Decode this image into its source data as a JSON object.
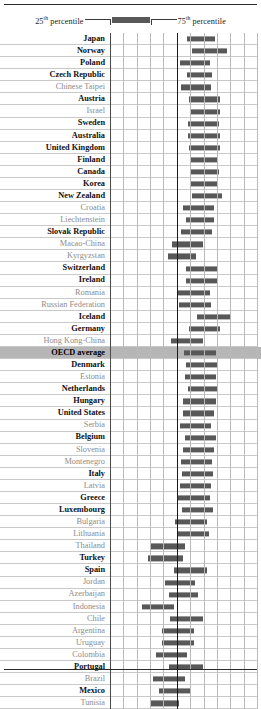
{
  "legend": {
    "left_label_prefix": "25",
    "left_label_sup": "th",
    "left_label_suffix": " percentile",
    "right_label_prefix": "75",
    "right_label_sup": "th",
    "right_label_suffix": " percentile",
    "bar_color": "#585858"
  },
  "chart_data": {
    "type": "bar",
    "subtype": "range-bar",
    "title": "",
    "xlabel": "",
    "ylabel": "",
    "grid": true,
    "legend_position": "top-center",
    "axis_reference_line": 500,
    "xlim": [
      300,
      740
    ],
    "xticks": [
      300,
      340,
      380,
      420,
      460,
      500,
      540,
      580,
      620,
      660,
      700,
      740
    ],
    "series_name": "Interquartile range of student score",
    "range_low_label": "25th percentile",
    "range_high_label": "75th percentile",
    "highlight_row": "OECD average",
    "highlight_color": "#b6b6b6",
    "categories": [
      "Japan",
      "Norway",
      "Poland",
      "Czech Republic",
      "Chinese Taipei",
      "Austria",
      "Israel",
      "Sweden",
      "Australia",
      "United Kingdom",
      "Finland",
      "Canada",
      "Korea",
      "New Zealand",
      "Croatia",
      "Liechtenstein",
      "Slovak Republic",
      "Macao-China",
      "Kyrgyzstan",
      "Switzerland",
      "Ireland",
      "Romania",
      "Russian Federation",
      "Iceland",
      "Germany",
      "Hong Kong-China",
      "OECD average",
      "Denmark",
      "Estonia",
      "Netherlands",
      "Hungary",
      "United States",
      "Serbia",
      "Belgium",
      "Slovenia",
      "Montenegro",
      "Italy",
      "Latvia",
      "Greece",
      "Luxembourg",
      "Bulgaria",
      "Lithuania",
      "Thailand",
      "Turkey",
      "Spain",
      "Jordan",
      "Azerbaijan",
      "Indonesia",
      "Chile",
      "Argentina",
      "Uruguay",
      "Colombia",
      "Portugal",
      "Brazil",
      "Mexico",
      "Tunisia"
    ],
    "member_type": [
      "oecd",
      "oecd",
      "oecd",
      "oecd",
      "partner",
      "oecd",
      "partner",
      "oecd",
      "oecd",
      "oecd",
      "oecd",
      "oecd",
      "oecd",
      "oecd",
      "partner",
      "partner",
      "oecd",
      "partner",
      "partner",
      "oecd",
      "oecd",
      "partner",
      "partner",
      "oecd",
      "oecd",
      "partner",
      "average",
      "oecd",
      "partner",
      "oecd",
      "oecd",
      "oecd",
      "partner",
      "oecd",
      "partner",
      "partner",
      "oecd",
      "partner",
      "oecd",
      "oecd",
      "partner",
      "partner",
      "partner",
      "oecd",
      "oecd",
      "partner",
      "partner",
      "partner",
      "partner",
      "partner",
      "partner",
      "partner",
      "oecd",
      "partner",
      "oecd",
      "partner"
    ],
    "low": [
      525,
      540,
      505,
      525,
      508,
      531,
      532,
      528,
      528,
      530,
      533,
      535,
      536,
      539,
      513,
      520,
      508,
      482,
      468,
      522,
      522,
      498,
      502,
      553,
      530,
      478,
      516,
      522,
      518,
      526,
      514,
      512,
      504,
      519,
      512,
      508,
      510,
      503,
      498,
      509,
      490,
      496,
      420,
      412,
      486,
      460,
      471,
      393,
      474,
      452,
      452,
      433,
      473,
      425,
      443,
      420
    ],
    "high": [
      605,
      642,
      590,
      598,
      593,
      620,
      620,
      619,
      621,
      622,
      615,
      618,
      614,
      627,
      603,
      604,
      596,
      570,
      550,
      613,
      614,
      590,
      595,
      653,
      620,
      572,
      608,
      613,
      608,
      615,
      609,
      604,
      594,
      610,
      604,
      598,
      601,
      595,
      591,
      600,
      582,
      588,
      518,
      512,
      583,
      549,
      557,
      486,
      572,
      546,
      545,
      523,
      570,
      520,
      536,
      500
    ]
  }
}
